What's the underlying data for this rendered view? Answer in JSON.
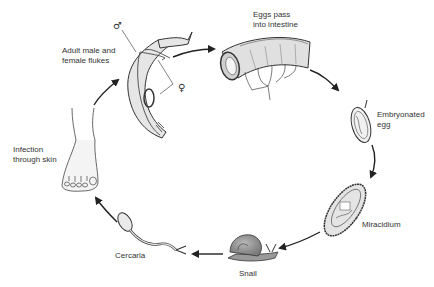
{
  "diagram": {
    "stages": [
      {
        "id": "adult",
        "label": "Adult male and\nfemale flukes"
      },
      {
        "id": "eggs",
        "label": "Eggs pass\ninto intestine"
      },
      {
        "id": "embryonated-egg",
        "label": "Embryonated\negg"
      },
      {
        "id": "miracidium",
        "label": "Miracidium"
      },
      {
        "id": "snail",
        "label": "Snail"
      },
      {
        "id": "cercaria",
        "label": "Cercaria"
      },
      {
        "id": "infection",
        "label": "Infection\nthrough skin"
      }
    ],
    "symbols": {
      "male": "♂",
      "female": "♀"
    },
    "colors": {
      "stroke": "#333333",
      "fill_light": "#e8e8e8",
      "fill_mid": "#c8c8c8",
      "fill_dark": "#9a9a9a",
      "text": "#333333"
    }
  }
}
